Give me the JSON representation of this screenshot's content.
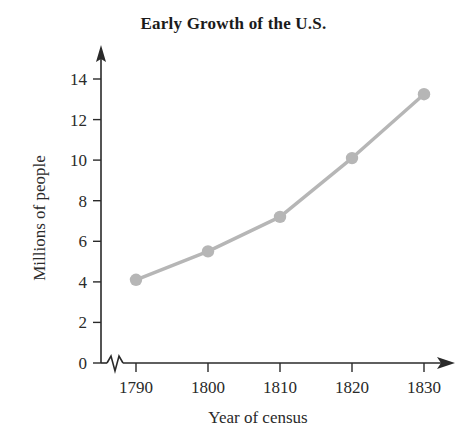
{
  "chart_data": {
    "type": "line",
    "title": "Early Growth of the U.S.",
    "xlabel": "Year of census",
    "ylabel": "Millions of people",
    "x": [
      1790,
      1800,
      1810,
      1820,
      1830
    ],
    "categories": [
      "1790",
      "1800",
      "1810",
      "1820",
      "1830"
    ],
    "values": [
      4.1,
      5.5,
      7.2,
      10.1,
      13.25
    ],
    "series": [
      {
        "name": "Population",
        "values": [
          4.1,
          5.5,
          7.2,
          10.1,
          13.25
        ]
      }
    ],
    "xtick_labels": [
      "1790",
      "1800",
      "1810",
      "1820",
      "1830"
    ],
    "ytick_labels": [
      "0",
      "2",
      "4",
      "6",
      "8",
      "10",
      "12",
      "14"
    ],
    "ytick_values": [
      0,
      2,
      4,
      6,
      8,
      10,
      12,
      14
    ],
    "ylim": [
      0,
      15
    ],
    "xlim": [
      1790,
      1830
    ],
    "grid": false,
    "legend": false,
    "legend_position": "none",
    "axis_break_x": true,
    "marker": "circle",
    "line_color": "#b6b6b6",
    "marker_color": "#b6b6b6",
    "axis_color": "#2a2a2a",
    "background_color": "#ffffff"
  }
}
